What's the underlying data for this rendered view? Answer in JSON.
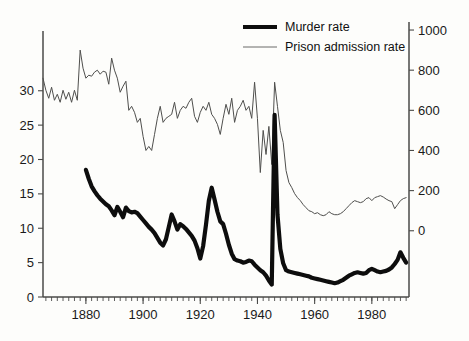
{
  "figure": {
    "width": 469,
    "height": 341,
    "background": "#fdfdfb"
  },
  "legend": {
    "position": "top-center",
    "entries": [
      {
        "label": "Murder rate",
        "style": "thick-black-line",
        "color": "#0d0d0d"
      },
      {
        "label": "Prison admission rate",
        "style": "thin-gray-line",
        "color": "#4f4f4d"
      }
    ]
  },
  "axes": {
    "x": {
      "label": "",
      "ticks": [
        "1880",
        "1900",
        "1920",
        "1940",
        "1960",
        "1980"
      ],
      "tick_values": [
        1880,
        1900,
        1920,
        1940,
        1960,
        1980
      ],
      "range": [
        1865,
        1993
      ],
      "minor_tick_interval": 2
    },
    "y_left": {
      "label": "",
      "ticks": [
        "0",
        "5",
        "10",
        "15",
        "20",
        "25",
        "30"
      ],
      "tick_values": [
        0,
        5,
        10,
        15,
        20,
        25,
        30
      ],
      "range": [
        0,
        40
      ],
      "series": "Murder rate"
    },
    "y_right": {
      "label": "",
      "ticks": [
        "0",
        "200",
        "400",
        "600",
        "800",
        "1000"
      ],
      "tick_values": [
        0,
        200,
        400,
        600,
        800,
        1000
      ],
      "range": [
        -330,
        1040
      ],
      "series": "Prison admission rate"
    }
  },
  "chart_data": {
    "type": "line",
    "title": "",
    "subtitle": "",
    "xlabel": "",
    "ylabel": "",
    "grid": false,
    "legend_position": "top-center",
    "xlim": [
      1865,
      1993
    ],
    "ylim": [
      0,
      40
    ],
    "ylim_right": [
      -330,
      1040
    ],
    "series": [
      {
        "name": "Murder rate",
        "axis": "left",
        "color": "#0d0d0d",
        "linewidth": 4.2,
        "x": [
          1880,
          1881,
          1882,
          1883,
          1884,
          1885,
          1886,
          1887,
          1888,
          1889,
          1890,
          1891,
          1892,
          1893,
          1894,
          1895,
          1896,
          1897,
          1898,
          1899,
          1900,
          1901,
          1902,
          1903,
          1904,
          1905,
          1906,
          1907,
          1908,
          1909,
          1910,
          1911,
          1912,
          1913,
          1914,
          1915,
          1916,
          1917,
          1918,
          1919,
          1920,
          1921,
          1922,
          1923,
          1924,
          1925,
          1926,
          1927,
          1928,
          1929,
          1930,
          1931,
          1932,
          1933,
          1934,
          1935,
          1936,
          1937,
          1938,
          1939,
          1940,
          1941,
          1942,
          1943,
          1944,
          1945,
          1946,
          1947,
          1948,
          1949,
          1950,
          1951,
          1952,
          1953,
          1954,
          1955,
          1956,
          1957,
          1958,
          1959,
          1960,
          1961,
          1962,
          1963,
          1964,
          1965,
          1966,
          1967,
          1968,
          1969,
          1970,
          1971,
          1972,
          1973,
          1974,
          1975,
          1976,
          1977,
          1978,
          1979,
          1980,
          1981,
          1982,
          1983,
          1984,
          1985,
          1986,
          1987,
          1988,
          1989,
          1990,
          1991,
          1992
        ],
        "values": [
          18.5,
          17.2,
          16.1,
          15.4,
          14.8,
          14.3,
          13.9,
          13.5,
          13.2,
          12.6,
          11.9,
          13.1,
          12.4,
          11.6,
          13.0,
          12.5,
          12.3,
          12.4,
          12.2,
          11.7,
          11.2,
          10.7,
          10.2,
          9.8,
          9.3,
          8.6,
          7.9,
          7.5,
          8.4,
          10.2,
          12.0,
          11.0,
          9.8,
          10.6,
          10.3,
          9.9,
          9.4,
          8.9,
          8.2,
          7.1,
          5.6,
          7.4,
          10.5,
          14.0,
          15.9,
          14.2,
          12.4,
          11.0,
          10.6,
          9.2,
          7.6,
          6.3,
          5.5,
          5.3,
          5.2,
          5.0,
          5.1,
          5.3,
          5.2,
          4.7,
          4.3,
          3.9,
          3.6,
          3.1,
          2.4,
          1.8,
          26.5,
          12.0,
          7.0,
          4.9,
          3.9,
          3.7,
          3.6,
          3.5,
          3.4,
          3.3,
          3.2,
          3.1,
          3.0,
          2.8,
          2.7,
          2.6,
          2.5,
          2.4,
          2.3,
          2.2,
          2.1,
          2.0,
          2.1,
          2.3,
          2.5,
          2.8,
          3.1,
          3.3,
          3.5,
          3.6,
          3.5,
          3.4,
          3.5,
          3.9,
          4.1,
          3.9,
          3.7,
          3.6,
          3.7,
          3.8,
          4.0,
          4.3,
          4.8,
          5.4,
          6.5,
          5.7,
          5.0
        ]
      },
      {
        "name": "Prison admission rate",
        "axis": "right",
        "color": "#4f4f4d",
        "linewidth": 1.0,
        "x": [
          1865,
          1866,
          1867,
          1868,
          1869,
          1870,
          1871,
          1872,
          1873,
          1874,
          1875,
          1876,
          1877,
          1878,
          1879,
          1880,
          1881,
          1882,
          1883,
          1884,
          1885,
          1886,
          1887,
          1888,
          1889,
          1890,
          1891,
          1892,
          1893,
          1894,
          1895,
          1896,
          1897,
          1898,
          1899,
          1900,
          1901,
          1902,
          1903,
          1904,
          1905,
          1906,
          1907,
          1908,
          1909,
          1910,
          1911,
          1912,
          1913,
          1914,
          1915,
          1916,
          1917,
          1918,
          1919,
          1920,
          1921,
          1922,
          1923,
          1924,
          1925,
          1926,
          1927,
          1928,
          1929,
          1930,
          1931,
          1932,
          1933,
          1934,
          1935,
          1936,
          1937,
          1938,
          1939,
          1940,
          1941,
          1942,
          1943,
          1944,
          1945,
          1946,
          1947,
          1948,
          1949,
          1950,
          1951,
          1952,
          1953,
          1954,
          1955,
          1956,
          1957,
          1958,
          1959,
          1960,
          1961,
          1962,
          1963,
          1964,
          1965,
          1966,
          1967,
          1968,
          1969,
          1970,
          1971,
          1972,
          1973,
          1974,
          1975,
          1976,
          1977,
          1978,
          1979,
          1980,
          1981,
          1982,
          1983,
          1984,
          1985,
          1986,
          1987,
          1988,
          1989,
          1990,
          1991,
          1992
        ],
        "values": [
          760,
          700,
          660,
          715,
          650,
          680,
          640,
          700,
          655,
          690,
          640,
          700,
          650,
          900,
          810,
          760,
          775,
          770,
          790,
          800,
          780,
          795,
          790,
          730,
          860,
          800,
          760,
          690,
          720,
          745,
          600,
          620,
          590,
          540,
          560,
          470,
          400,
          420,
          400,
          480,
          560,
          620,
          540,
          560,
          570,
          580,
          640,
          560,
          600,
          620,
          610,
          640,
          660,
          570,
          540,
          590,
          620,
          600,
          640,
          580,
          560,
          530,
          480,
          560,
          630,
          580,
          660,
          540,
          600,
          620,
          650,
          600,
          620,
          560,
          740,
          560,
          290,
          500,
          380,
          520,
          330,
          740,
          620,
          500,
          440,
          300,
          240,
          215,
          185,
          165,
          150,
          130,
          115,
          100,
          95,
          85,
          90,
          80,
          75,
          80,
          95,
          85,
          80,
          80,
          85,
          95,
          110,
          125,
          140,
          150,
          145,
          140,
          145,
          160,
          165,
          150,
          165,
          170,
          175,
          168,
          158,
          150,
          145,
          110,
          130,
          150,
          160,
          165
        ]
      }
    ]
  }
}
